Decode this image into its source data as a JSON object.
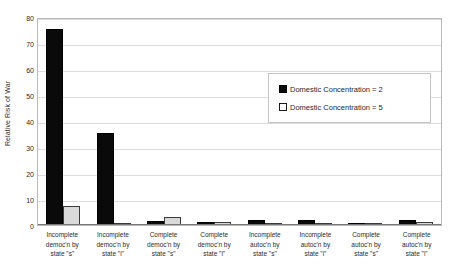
{
  "chart_data": {
    "type": "bar",
    "title": "",
    "xlabel": "",
    "ylabel": "Relative Risk of War",
    "ylim": [
      0,
      80
    ],
    "yticks": [
      0,
      10,
      20,
      30,
      40,
      50,
      60,
      70,
      80
    ],
    "grid": true,
    "legend_position": "upper-right-inside",
    "categories": [
      "Incomplete democ'n by state \"s\"",
      "Incomplete democ'n by state \"i\"",
      "Complete democ'n by state \"s\"",
      "Complete democ'n by state \"i\"",
      "Incomplete autoc'n by state \"s\"",
      "Incomplete autoc'n by state \"i\"",
      "Complete autoc'n by state \"s\"",
      "Complete autoc'n by state \"i\""
    ],
    "category_lines": [
      [
        "Incomplete",
        "democ'n by",
        "state \"s\""
      ],
      [
        "Incomplete",
        "democ'n by",
        "state \"i\""
      ],
      [
        "Complete",
        "democ'n by",
        "state \"s\""
      ],
      [
        "Complete",
        "democ'n by",
        "state \"i\""
      ],
      [
        "Incomplete",
        "autoc'n by",
        "state \"s\""
      ],
      [
        "Incomplete",
        "autoc'n by",
        "state \"i\""
      ],
      [
        "Complete",
        "autoc'n by",
        "state \"s\""
      ],
      [
        "Complete",
        "autoc'n by",
        "state \"i\""
      ]
    ],
    "series": [
      {
        "name": "Domestic Concentration = 2",
        "color": "#000000",
        "values": [
          75.5,
          35.5,
          1.5,
          1.0,
          1.8,
          1.8,
          0.8,
          2.0
        ]
      },
      {
        "name": "Domestic Concentration = 5",
        "color": "#d9d9d9",
        "values": [
          7.5,
          0.8,
          3.0,
          1.3,
          0.9,
          0.9,
          0.5,
          1.0
        ]
      }
    ]
  },
  "legend": {
    "items": [
      {
        "label": "Domestic Concentration = 2"
      },
      {
        "label": "Domestic Concentration = 5"
      }
    ]
  },
  "axes": {
    "y_title": "Relative Risk of War",
    "y_ticks": [
      "0",
      "10",
      "20",
      "30",
      "40",
      "50",
      "60",
      "70",
      "80"
    ]
  }
}
